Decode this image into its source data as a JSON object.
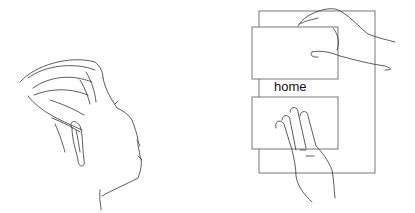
{
  "figure": {
    "left_panel": {
      "subject": "head-profile-line-drawing"
    },
    "right_panel": {
      "subject": "hands-on-page-with-two-panels",
      "label": "home"
    }
  }
}
